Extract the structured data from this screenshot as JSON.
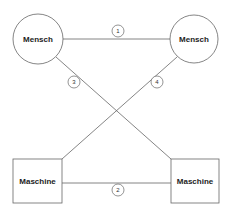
{
  "diagram": {
    "nodes": [
      {
        "id": "human-left",
        "shape": "circle",
        "label": "Mensch",
        "cx": 38,
        "cy": 39,
        "r": 25
      },
      {
        "id": "human-right",
        "shape": "circle",
        "label": "Mensch",
        "cx": 194,
        "cy": 39,
        "r": 24
      },
      {
        "id": "machine-left",
        "shape": "rect",
        "label": "Maschine",
        "x": 13,
        "y": 159,
        "w": 49,
        "h": 44
      },
      {
        "id": "machine-right",
        "shape": "rect",
        "label": "Maschine",
        "x": 171,
        "y": 159,
        "w": 48,
        "h": 44
      }
    ],
    "edges": [
      {
        "label": "1",
        "from": "human-left",
        "to": "human-right"
      },
      {
        "label": "2",
        "from": "machine-left",
        "to": "machine-right"
      },
      {
        "label": "3",
        "from": "human-left",
        "to": "machine-right"
      },
      {
        "label": "4",
        "from": "human-right",
        "to": "machine-left"
      }
    ],
    "colors": {
      "stroke": "#666666",
      "text": "#222222",
      "background": "#ffffff"
    }
  }
}
